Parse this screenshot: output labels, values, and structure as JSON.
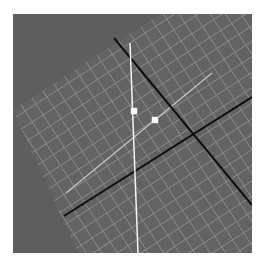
{
  "viewport": {
    "name": "3d-viewport",
    "background": "#5e5e5e",
    "width": 239,
    "height": 239
  },
  "grid_plane": {
    "fill": "#636363",
    "line_color": "#8c8c8c",
    "cell_size": 13,
    "corners": [
      [
        0,
        96
      ],
      [
        147,
        0
      ],
      [
        239,
        0
      ],
      [
        239,
        239
      ],
      [
        65,
        239
      ]
    ]
  },
  "axes": {
    "color": "#0e0e0e",
    "axis_a": {
      "from": [
        101,
        24
      ],
      "to": [
        239,
        191
      ]
    },
    "axis_b": {
      "from": [
        51,
        202
      ],
      "to": [
        239,
        83
      ]
    }
  },
  "vertical_guide": {
    "color": "#f2f2f2",
    "from": [
      117,
      29
    ],
    "to": [
      125,
      239
    ]
  },
  "diagonal_guide": {
    "color": "#c8c8c8",
    "from": [
      53,
      179
    ],
    "to": [
      199,
      59
    ]
  },
  "handles": [
    {
      "name": "handle-top",
      "x": 121,
      "y": 97,
      "size": 6,
      "color": "#ffffff"
    },
    {
      "name": "handle-right",
      "x": 142,
      "y": 106,
      "size": 6,
      "color": "#ffffff"
    }
  ]
}
